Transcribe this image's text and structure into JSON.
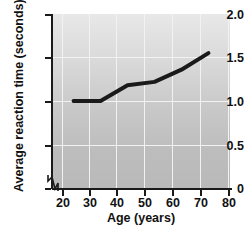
{
  "chart_data": {
    "type": "line",
    "title": "",
    "xlabel": "Age (years)",
    "ylabel": "Average reaction time (seconds)",
    "xlim": [
      17,
      83
    ],
    "ylim": [
      0,
      2.0
    ],
    "xticks": [
      20,
      30,
      40,
      50,
      60,
      70,
      80
    ],
    "xtick_labels": [
      "20",
      "30",
      "40",
      "50",
      "60",
      "70",
      "80"
    ],
    "yticks": [
      0,
      0.5,
      1.0,
      1.5,
      2.0
    ],
    "ytick_labels": [
      "0",
      "0.5",
      "1.0",
      "1.5",
      "2.0"
    ],
    "grid": true,
    "legend": null,
    "axis_break": "y-axis origin zigzag",
    "series": [
      {
        "name": "Average reaction time",
        "color": "#1a1a1a",
        "x": [
          25,
          35,
          45,
          55,
          65,
          75
        ],
        "y": [
          1.0,
          1.0,
          1.18,
          1.22,
          1.36,
          1.55
        ]
      }
    ]
  },
  "axes": {
    "x_title": "Age (years)",
    "y_title": "Average reaction time (seconds)"
  },
  "colors": {
    "line": "#1a1a1a",
    "grid": "#f2f2f2",
    "axis": "#1a1a1a",
    "plot_bg_top": "#e8e8e8",
    "plot_bg_bottom": "#b9b9b9",
    "page_bg": "#ffffff"
  }
}
